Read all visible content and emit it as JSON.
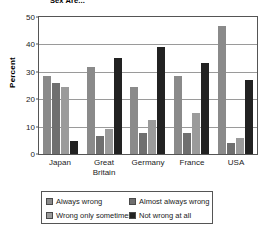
{
  "chart_data": {
    "type": "bar",
    "title": "Sex Are...",
    "xlabel": "",
    "ylabel": "Percent",
    "ylim": [
      0,
      50
    ],
    "yticks": [
      0,
      10,
      20,
      30,
      40,
      50
    ],
    "grid": true,
    "legend_position": "bottom",
    "categories": [
      "Japan",
      "Great Britain",
      "Germany",
      "France",
      "USA"
    ],
    "category_lines": [
      [
        "Japan"
      ],
      [
        "Great",
        "Britain"
      ],
      [
        "Germany"
      ],
      [
        "France"
      ],
      [
        "USA"
      ]
    ],
    "series": [
      {
        "name": "Always wrong",
        "color": "#8a8a8a",
        "values": [
          28.5,
          31.6,
          24.3,
          28.5,
          46.7
        ]
      },
      {
        "name": "Almost always wrong",
        "color": "#6f6f6f",
        "values": [
          25.9,
          6.6,
          7.5,
          7.5,
          4.1
        ]
      },
      {
        "name": "Wrong only sometimes",
        "color": "#9b9b9b",
        "values": [
          24.3,
          9.3,
          12.4,
          15.0,
          5.7
        ]
      },
      {
        "name": "Not wrong at all",
        "color": "#222222",
        "values": [
          4.9,
          35.0,
          39.1,
          33.3,
          26.9
        ]
      }
    ]
  }
}
